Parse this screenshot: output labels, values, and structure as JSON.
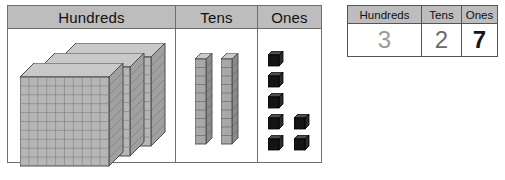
{
  "blocks_chart": {
    "columns": [
      {
        "label": "Hundreds",
        "block_type": "hundred-flat",
        "count": 3
      },
      {
        "label": "Tens",
        "block_type": "ten-rod",
        "count": 2
      },
      {
        "label": "Ones",
        "block_type": "unit-cube",
        "count": 7
      }
    ]
  },
  "digit_table": {
    "headers": [
      "Hundreds",
      "Tens",
      "Ones"
    ],
    "digits": [
      "3",
      "2",
      "7"
    ]
  },
  "colors": {
    "header_band": "#bdbdbd",
    "table_border": "#6e6e6e",
    "flat_face": "#b0b0b0",
    "rod_face": "#8f8f8f",
    "cube_face": "#1c1c1c",
    "digit_hundreds": "#9a9a9a",
    "digit_tens": "#6a6a6a",
    "digit_ones": "#151515"
  }
}
